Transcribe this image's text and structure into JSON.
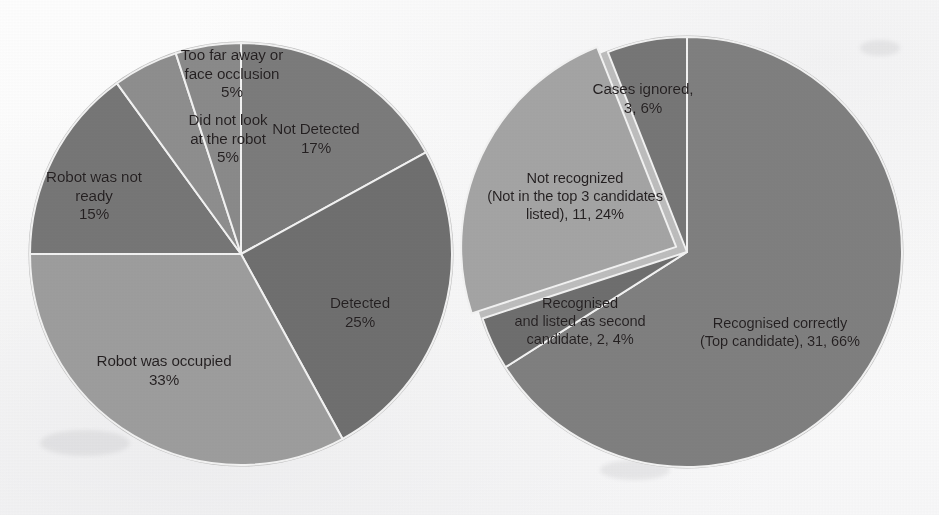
{
  "figure": {
    "background_color": "#fbfbfb",
    "label_color": "#231f20",
    "separator_color": "#f2f2f2"
  },
  "chart_data": [
    {
      "type": "pie",
      "name": "face-detection-outcomes",
      "title": "",
      "position": "left",
      "center": [
        241,
        254
      ],
      "radius": 211,
      "start_angle_deg": 0,
      "direction": "clockwise",
      "legend": "none",
      "labels_inside": true,
      "categories": [
        "Not Detected",
        "Detected",
        "Robot was occupied",
        "Robot was not ready",
        "Did not look at the robot",
        "Too far away or face occlusion"
      ],
      "values": [
        17,
        25,
        33,
        15,
        5,
        5
      ],
      "value_suffix": "%",
      "slices": [
        {
          "label": "Not Detected",
          "percent": 17,
          "percent_text": "17%",
          "label_lines": [
            "Not Detected",
            "17%"
          ],
          "color": "#7b7b7b",
          "label_pos": [
            316,
            139
          ]
        },
        {
          "label": "Detected",
          "percent": 25,
          "percent_text": "25%",
          "label_lines": [
            "Detected",
            "25%"
          ],
          "color": "#6f6f6f",
          "label_pos": [
            360,
            313
          ]
        },
        {
          "label": "Robot was occupied",
          "percent": 33,
          "percent_text": "33%",
          "label_lines": [
            "Robot was occupied",
            "33%"
          ],
          "color": "#9d9d9d",
          "label_pos": [
            164,
            371
          ]
        },
        {
          "label": "Robot was not ready",
          "percent": 15,
          "percent_text": "15%",
          "label_lines": [
            "Robot was not",
            "ready",
            "15%"
          ],
          "color": "#767676",
          "label_pos": [
            94,
            196
          ]
        },
        {
          "label": "Did not look at the robot",
          "percent": 5,
          "percent_text": "5%",
          "label_lines": [
            "Did not look",
            "at the robot",
            "5%"
          ],
          "color": "#8e8e8e",
          "label_pos": [
            228,
            139
          ]
        },
        {
          "label": "Too far away or face occlusion",
          "percent": 5,
          "percent_text": "5%",
          "label_lines": [
            "Too far away or",
            "face occlusion",
            "5%"
          ],
          "color": "#8a8a8a",
          "label_pos": [
            232,
            74
          ]
        }
      ]
    },
    {
      "type": "pie",
      "name": "face-recognition-outcomes",
      "title": "",
      "position": "right",
      "center": [
        687,
        252
      ],
      "radius": 215,
      "start_angle_deg": 0,
      "direction": "clockwise",
      "legend": "none",
      "labels_inside": true,
      "categories": [
        "Recognised correctly (Top candidate)",
        "Recognised and listed as second candidate",
        "Not recognized (Not in the top 3 candidates listed)",
        "Cases ignored"
      ],
      "values": [
        31,
        2,
        11,
        3
      ],
      "percents": [
        66,
        4,
        24,
        6
      ],
      "total": 47,
      "slices": [
        {
          "label": "Recognised correctly (Top candidate)",
          "count": 31,
          "percent": 66,
          "label_lines": [
            "Recognised correctly",
            "(Top candidate), 31, 66%"
          ],
          "color": "#7f7f7f",
          "label_pos": [
            780,
            333
          ],
          "exploded": false
        },
        {
          "label": "Recognised and listed as second candidate",
          "count": 2,
          "percent": 4,
          "label_lines": [
            "Recognised",
            "and listed as second",
            "candidate, 2, 4%"
          ],
          "color": "#6e6e6e",
          "label_pos": [
            580,
            322
          ],
          "exploded": false
        },
        {
          "label": "Not recognized (Not in the top 3 candidates listed)",
          "count": 11,
          "percent": 24,
          "label_lines": [
            "Not recognized",
            "(Not in the top 3 candidates",
            "listed), 11, 24%"
          ],
          "color": "#a4a4a4",
          "label_pos": [
            575,
            197
          ],
          "exploded": true,
          "explode_offset": 12
        },
        {
          "label": "Cases ignored",
          "count": 3,
          "percent": 6,
          "label_lines": [
            "Cases ignored,",
            "3, 6%"
          ],
          "color": "#767676",
          "label_pos": [
            643,
            99
          ],
          "exploded": false
        }
      ]
    }
  ]
}
